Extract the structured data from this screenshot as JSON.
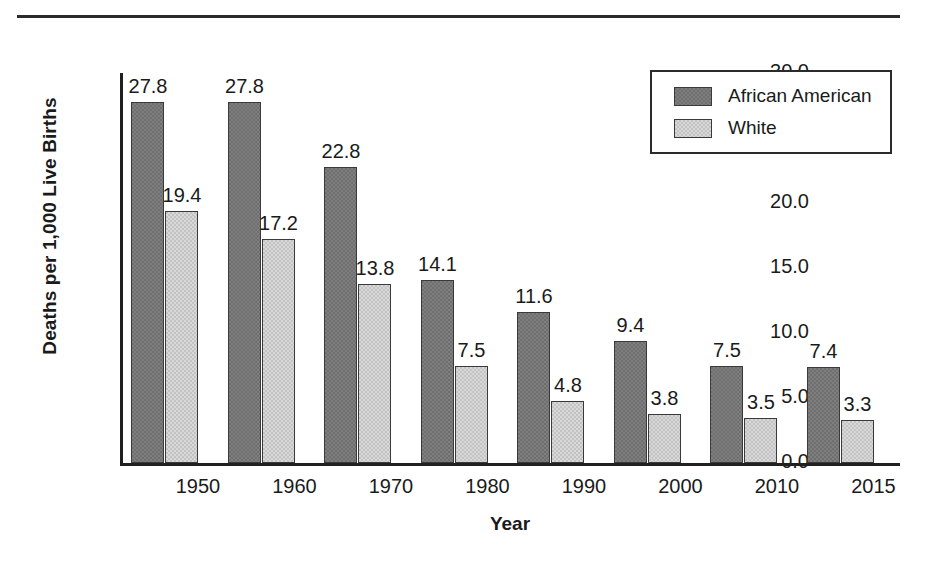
{
  "chart_data": {
    "type": "bar",
    "title": "",
    "subtitle": "",
    "xlabel": "Year",
    "ylabel": "Deaths per 1,000 Live Births",
    "categories": [
      "1950",
      "1960",
      "1970",
      "1980",
      "1990",
      "2000",
      "2010",
      "2015"
    ],
    "series": [
      {
        "name": "African American",
        "color": "#6f6f6f",
        "values": [
          27.8,
          27.8,
          22.8,
          14.1,
          11.6,
          9.4,
          7.5,
          7.4
        ],
        "labels": [
          "27.8",
          "27.8",
          "22.8",
          "14.1",
          "11.6",
          "9.4",
          "7.5",
          "7.4"
        ]
      },
      {
        "name": "White",
        "color": "#c3c3c3",
        "values": [
          19.4,
          17.2,
          13.8,
          7.5,
          4.8,
          3.8,
          3.5,
          3.3
        ],
        "labels": [
          "19.4",
          "17.2",
          "13.8",
          "7.5",
          "4.8",
          "3.8",
          "3.5",
          "3.3"
        ]
      }
    ],
    "ylim": [
      0,
      30
    ],
    "ytick_values": [
      30.0,
      25.0,
      20.0,
      15.0,
      10.0,
      5.0,
      0.0
    ],
    "ytick_labels": [
      "30.0",
      "25.0",
      "20.0",
      "15.0",
      "10.0",
      "5.0",
      "0.0"
    ],
    "grid": false,
    "legend_position": "top-right",
    "data_labels": true,
    "axis_color": "#202020",
    "text_color": "#1a1a1a",
    "background": "#ffffff"
  },
  "legend": {
    "entries": [
      {
        "label": "African American"
      },
      {
        "label": "White"
      }
    ]
  },
  "decorations": {
    "top_rule_color": "#2b2b2b"
  }
}
